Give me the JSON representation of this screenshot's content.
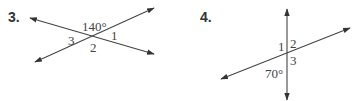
{
  "problems": [
    {
      "number": "3.",
      "given_angle": "140°",
      "angle_labels": [
        "1",
        "2",
        "3"
      ]
    },
    {
      "number": "4.",
      "given_angle": "70°",
      "angle_labels": [
        "1",
        "2",
        "3"
      ]
    }
  ],
  "colors": {
    "line": "#444444",
    "text": "#444444"
  }
}
